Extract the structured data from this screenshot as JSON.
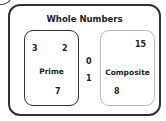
{
  "diagram": {
    "title": "Whole Numbers",
    "sets": [
      {
        "label": "Prime",
        "members": [
          "3",
          "2",
          "7"
        ]
      },
      {
        "label": "Composite",
        "members": [
          "15",
          "8"
        ]
      }
    ],
    "outside": [
      "0",
      "1"
    ]
  }
}
